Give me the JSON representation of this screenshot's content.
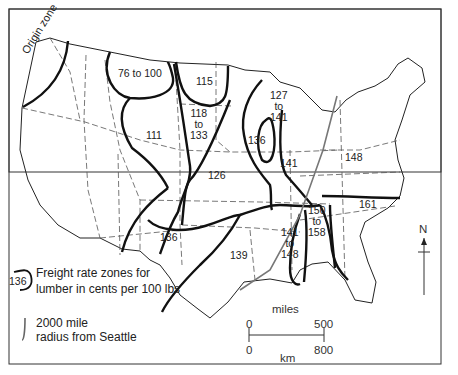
{
  "map": {
    "title": "Freight rate zones for lumber, United States",
    "origin_zone_label": "Origin zone",
    "zones": [
      {
        "id": "z76",
        "label": "76 to 100",
        "x": 132,
        "y": 73
      },
      {
        "id": "z115",
        "label": "115",
        "x": 205,
        "y": 81
      },
      {
        "id": "z111",
        "label": "111",
        "x": 155,
        "y": 135
      },
      {
        "id": "z118",
        "label": "118\nto\n133",
        "x": 198,
        "y": 113
      },
      {
        "id": "z126",
        "label": "126",
        "x": 216,
        "y": 176
      },
      {
        "id": "z127",
        "label": "127\nto\n141",
        "x": 278,
        "y": 95
      },
      {
        "id": "z136a",
        "label": "136",
        "x": 255,
        "y": 140
      },
      {
        "id": "z141",
        "label": "141",
        "x": 288,
        "y": 163
      },
      {
        "id": "z148",
        "label": "148",
        "x": 353,
        "y": 157
      },
      {
        "id": "z136b",
        "label": "136",
        "x": 168,
        "y": 237
      },
      {
        "id": "z139",
        "label": "139",
        "x": 238,
        "y": 255
      },
      {
        "id": "z141b",
        "label": "141\nto\n148",
        "x": 289,
        "y": 232
      },
      {
        "id": "z150",
        "label": "150\nto\n158",
        "x": 316,
        "y": 210
      },
      {
        "id": "z161",
        "label": "161",
        "x": 367,
        "y": 204
      }
    ]
  },
  "legend": {
    "zone_sample": "136",
    "zone_text_line1": "Freight rate zones for",
    "zone_text_line2": "lumber in cents per 100 lbs",
    "radius_text_line1": "2000 mile",
    "radius_text_line2": "radius from Seattle"
  },
  "scale": {
    "miles_label": "miles",
    "km_label": "km",
    "miles_start": "0",
    "miles_end": "500",
    "km_start": "0",
    "km_end": "800"
  },
  "north_arrow": {
    "label": "N"
  }
}
